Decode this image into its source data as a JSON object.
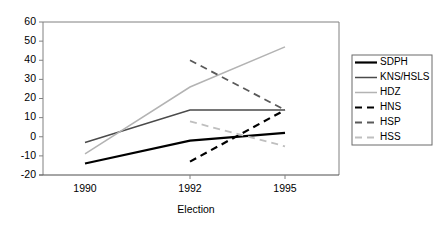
{
  "chart_data": {
    "type": "line",
    "title": "",
    "xlabel": "Election",
    "ylabel": "",
    "categories": [
      "1990",
      "1992",
      "1995"
    ],
    "ylim": [
      -20,
      60
    ],
    "yticks": [
      -20,
      -10,
      0,
      10,
      20,
      30,
      40,
      50,
      60
    ],
    "grid": false,
    "legend_position": "right",
    "series": [
      {
        "name": "SDPH",
        "values": [
          -14,
          -2,
          2
        ],
        "color": "#000000",
        "width": 2.2,
        "dash": "none"
      },
      {
        "name": "KNS/HSLS",
        "values": [
          -3,
          14,
          14
        ],
        "color": "#4a4a4a",
        "width": 1.5,
        "dash": "none"
      },
      {
        "name": "HDZ",
        "values": [
          -9,
          26,
          47
        ],
        "color": "#b3b3b3",
        "width": 1.5,
        "dash": "none"
      },
      {
        "name": "HNS",
        "values": [
          null,
          -13,
          14
        ],
        "color": "#000000",
        "width": 2.2,
        "dash": "7,5"
      },
      {
        "name": "HSP",
        "values": [
          null,
          40,
          14
        ],
        "color": "#5a5a5a",
        "width": 1.8,
        "dash": "7,5"
      },
      {
        "name": "HSS",
        "values": [
          null,
          8,
          -5
        ],
        "color": "#bfbfbf",
        "width": 1.8,
        "dash": "7,5"
      }
    ]
  },
  "axis": {
    "y_labels": [
      "60",
      "50",
      "40",
      "30",
      "20",
      "10",
      "0",
      "-10",
      "-20"
    ],
    "x_labels": [
      "1990",
      "1992",
      "1995"
    ],
    "x_title": "Election"
  },
  "legend": {
    "items": [
      {
        "label": "SDPH"
      },
      {
        "label": "KNS/HSLS"
      },
      {
        "label": "HDZ"
      },
      {
        "label": "HNS"
      },
      {
        "label": "HSP"
      },
      {
        "label": "HSS"
      }
    ]
  },
  "colors": {
    "background": "#ffffff",
    "axis": "#4d4d4d",
    "border": "#808080",
    "text": "#000000"
  }
}
